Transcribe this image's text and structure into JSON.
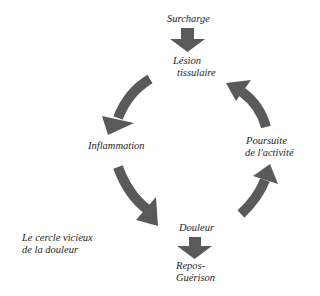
{
  "diagram": {
    "title_line1": "Le cercle vicieux",
    "title_line2": "de la douleur",
    "nodes": {
      "surcharge": "Surcharge",
      "lesion_line1": "Lésion",
      "lesion_line2": "tissulaire",
      "inflammation": "Inflammation",
      "douleur": "Douleur",
      "repos_line1": "Repos-",
      "repos_line2": "Guérison",
      "poursuite_line1": "Poursuite",
      "poursuite_line2": "de l'activité"
    },
    "edges": [
      {
        "from": "Surcharge",
        "to": "Lésion tissulaire",
        "style": "straight-down"
      },
      {
        "from": "Lésion tissulaire",
        "to": "Inflammation",
        "style": "curved"
      },
      {
        "from": "Inflammation",
        "to": "Douleur",
        "style": "curved"
      },
      {
        "from": "Douleur",
        "to": "Repos-Guérison",
        "style": "straight-down"
      },
      {
        "from": "Douleur",
        "to": "Poursuite de l'activité",
        "style": "curved"
      },
      {
        "from": "Poursuite de l'activité",
        "to": "Lésion tissulaire",
        "style": "curved"
      }
    ],
    "colors": {
      "arrow": "#5a5a5a",
      "text": "#1e1e1e",
      "background": "#ffffff"
    }
  }
}
